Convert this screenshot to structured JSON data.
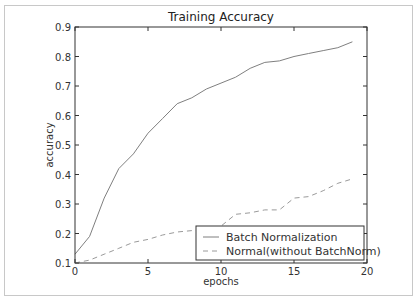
{
  "chart_data": {
    "type": "line",
    "title": "Training Accuracy",
    "xlabel": "epochs",
    "ylabel": "accuracy",
    "xlim": [
      0,
      20
    ],
    "ylim": [
      0.1,
      0.9
    ],
    "xticks": [
      "0",
      "5",
      "10",
      "15",
      "20"
    ],
    "yticks": [
      "0.1",
      "0.2",
      "0.3",
      "0.4",
      "0.5",
      "0.6",
      "0.7",
      "0.8",
      "0.9"
    ],
    "grid": false,
    "legend_position": "lower right",
    "x": [
      0,
      1,
      2,
      3,
      4,
      5,
      6,
      7,
      8,
      9,
      10,
      11,
      12,
      13,
      14,
      15,
      16,
      17,
      18,
      19
    ],
    "series": [
      {
        "name": "Batch Normalization",
        "style": "solid",
        "color": "#7f7f7f",
        "values": [
          0.13,
          0.19,
          0.32,
          0.42,
          0.47,
          0.54,
          0.59,
          0.64,
          0.66,
          0.69,
          0.71,
          0.73,
          0.76,
          0.78,
          0.785,
          0.8,
          0.81,
          0.82,
          0.83,
          0.85
        ]
      },
      {
        "name": "Normal(without BatchNorm)",
        "style": "dashed",
        "color": "#9a9a9a",
        "values": [
          0.1,
          0.11,
          0.13,
          0.15,
          0.17,
          0.18,
          0.195,
          0.205,
          0.21,
          0.21,
          0.225,
          0.265,
          0.27,
          0.28,
          0.28,
          0.32,
          0.325,
          0.345,
          0.37,
          0.385
        ]
      }
    ]
  }
}
